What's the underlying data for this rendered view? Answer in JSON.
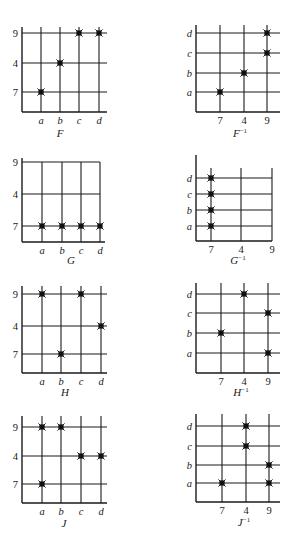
{
  "figure": {
    "background": "#ffffff",
    "ink_color": "#1a1a1a",
    "panels": [
      {
        "id": "F",
        "title": "F",
        "superscript": "",
        "x_labels": [
          "a",
          "b",
          "c",
          "d"
        ],
        "y_labels": [
          "9",
          "4",
          "7"
        ],
        "x_italic": true,
        "y_italic": false,
        "origin": [
          22,
          112
        ],
        "x_pos": [
          41,
          60,
          79,
          99
        ],
        "y_pos": [
          33,
          63,
          92
        ],
        "right": 107,
        "top": 27,
        "closed_top": false,
        "title_pos": [
          60,
          137
        ],
        "points": [
          [
            "a",
            "7"
          ],
          [
            "b",
            "4"
          ],
          [
            "c",
            "9"
          ],
          [
            "d",
            "9"
          ]
        ]
      },
      {
        "id": "F-inv",
        "title": "F",
        "superscript": "−1",
        "x_labels": [
          "7",
          "4",
          "9"
        ],
        "y_labels": [
          "d",
          "c",
          "b",
          "a"
        ],
        "x_italic": false,
        "y_italic": true,
        "origin": [
          196,
          112
        ],
        "x_pos": [
          220,
          244,
          267
        ],
        "y_pos": [
          33,
          53,
          73,
          92
        ],
        "right": 280,
        "top": 25,
        "closed_top": false,
        "title_pos": [
          240,
          137
        ],
        "points": [
          [
            "7",
            "a"
          ],
          [
            "4",
            "b"
          ],
          [
            "9",
            "c"
          ],
          [
            "9",
            "d"
          ]
        ]
      },
      {
        "id": "G",
        "title": "G",
        "superscript": "",
        "x_labels": [
          "a",
          "b",
          "c",
          "d"
        ],
        "y_labels": [
          "9",
          "4",
          "7"
        ],
        "x_italic": true,
        "y_italic": false,
        "origin": [
          22,
          242
        ],
        "x_pos": [
          42,
          62,
          81,
          100
        ],
        "y_pos": [
          162,
          194,
          226
        ],
        "right": 105,
        "top": 158,
        "closed_top": true,
        "title_pos": [
          71,
          264
        ],
        "points": [
          [
            "a",
            "7"
          ],
          [
            "b",
            "7"
          ],
          [
            "c",
            "7"
          ],
          [
            "d",
            "7"
          ]
        ]
      },
      {
        "id": "G-inv",
        "title": "G",
        "superscript": "−1",
        "x_labels": [
          "7",
          "4",
          "9"
        ],
        "y_labels": [
          "d",
          "c",
          "b",
          "a"
        ],
        "x_italic": false,
        "y_italic": true,
        "origin": [
          196,
          241
        ],
        "x_pos": [
          211,
          241,
          272
        ],
        "y_pos": [
          178,
          194,
          210,
          226
        ],
        "right": 272,
        "top": 155,
        "vtop": 168,
        "closed_top": false,
        "title_pos": [
          238,
          264
        ],
        "points": [
          [
            "7",
            "a"
          ],
          [
            "7",
            "b"
          ],
          [
            "7",
            "c"
          ],
          [
            "7",
            "d"
          ]
        ]
      },
      {
        "id": "H",
        "title": "H",
        "superscript": "",
        "x_labels": [
          "a",
          "b",
          "c",
          "d"
        ],
        "y_labels": [
          "9",
          "4",
          "7"
        ],
        "x_italic": true,
        "y_italic": false,
        "origin": [
          22,
          373
        ],
        "x_pos": [
          42,
          61,
          81,
          101
        ],
        "y_pos": [
          294,
          326,
          354
        ],
        "right": 107,
        "top": 286,
        "closed_top": false,
        "title_pos": [
          65,
          396
        ],
        "points": [
          [
            "a",
            "9"
          ],
          [
            "b",
            "7"
          ],
          [
            "c",
            "9"
          ],
          [
            "d",
            "4"
          ]
        ]
      },
      {
        "id": "H-inv",
        "title": "H",
        "superscript": "−1",
        "x_labels": [
          "7",
          "4",
          "9"
        ],
        "y_labels": [
          "d",
          "c",
          "b",
          "a"
        ],
        "x_italic": false,
        "y_italic": true,
        "origin": [
          196,
          373
        ],
        "x_pos": [
          221,
          244,
          268
        ],
        "y_pos": [
          294,
          313,
          333,
          353
        ],
        "right": 280,
        "top": 283,
        "closed_top": false,
        "title_pos": [
          241,
          396
        ],
        "points": [
          [
            "7",
            "b"
          ],
          [
            "4",
            "d"
          ],
          [
            "9",
            "c"
          ],
          [
            "9",
            "a"
          ]
        ]
      },
      {
        "id": "J",
        "title": "J",
        "superscript": "",
        "x_labels": [
          "a",
          "b",
          "c",
          "d"
        ],
        "y_labels": [
          "9",
          "4",
          "7"
        ],
        "x_italic": true,
        "y_italic": false,
        "origin": [
          22,
          503
        ],
        "x_pos": [
          42,
          61,
          81,
          101
        ],
        "y_pos": [
          427,
          456,
          484
        ],
        "right": 107,
        "top": 416,
        "closed_top": false,
        "title_pos": [
          64,
          527
        ],
        "points": [
          [
            "a",
            "9"
          ],
          [
            "a",
            "7"
          ],
          [
            "b",
            "9"
          ],
          [
            "c",
            "4"
          ],
          [
            "d",
            "4"
          ]
        ]
      },
      {
        "id": "J-inv",
        "title": "J",
        "superscript": "−1",
        "x_labels": [
          "7",
          "4",
          "9"
        ],
        "y_labels": [
          "d",
          "c",
          "b",
          "a"
        ],
        "x_italic": false,
        "y_italic": true,
        "origin": [
          196,
          502
        ],
        "x_pos": [
          222,
          246,
          269
        ],
        "y_pos": [
          426,
          446,
          465,
          483
        ],
        "right": 280,
        "top": 414,
        "closed_top": false,
        "title_pos": [
          244,
          526
        ],
        "points": [
          [
            "7",
            "a"
          ],
          [
            "4",
            "c"
          ],
          [
            "4",
            "d"
          ],
          [
            "9",
            "b"
          ],
          [
            "9",
            "a"
          ]
        ]
      }
    ]
  }
}
